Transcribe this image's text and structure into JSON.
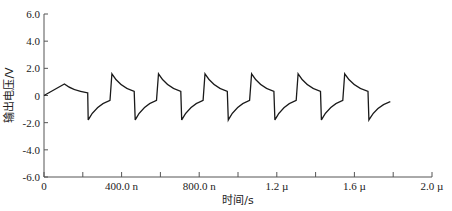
{
  "chart_data": {
    "type": "line",
    "title": "",
    "xlabel": "时间/s",
    "ylabel": "输出电压/V",
    "xlim": [
      0,
      2e-06
    ],
    "ylim": [
      -6.0,
      6.0
    ],
    "grid": false,
    "legend": null,
    "x_ticks": [
      {
        "value": 0,
        "label": "0"
      },
      {
        "value": 4e-07,
        "label": "400.0 n"
      },
      {
        "value": 8e-07,
        "label": "800.0 n"
      },
      {
        "value": 1.2e-06,
        "label": "1.2 µ"
      },
      {
        "value": 1.6e-06,
        "label": "1.6 µ"
      },
      {
        "value": 2e-06,
        "label": "2.0 µ"
      }
    ],
    "x_minor_ticks": [
      2e-07,
      6e-07,
      1e-06,
      1.4e-06,
      1.8e-06
    ],
    "y_ticks": [
      {
        "value": 6.0,
        "label": "6.0"
      },
      {
        "value": 4.0,
        "label": "4.0"
      },
      {
        "value": 2.0,
        "label": "2.0"
      },
      {
        "value": 0,
        "label": "0"
      },
      {
        "value": -2.0,
        "label": "-2.0"
      },
      {
        "value": -4.0,
        "label": "-4.0"
      },
      {
        "value": -6.0,
        "label": "-6.0"
      }
    ],
    "series": [
      {
        "name": "输出电压",
        "color": "#1a1a1a",
        "x_ns": [
          0,
          105,
          225,
          228,
          340,
          350,
          465,
          470,
          580,
          590,
          705,
          710,
          820,
          830,
          945,
          950,
          1060,
          1070,
          1185,
          1190,
          1300,
          1310,
          1425,
          1430,
          1540,
          1550,
          1670,
          1675,
          1785
        ],
        "y": [
          0,
          0.85,
          0.2,
          -1.8,
          -0.35,
          1.6,
          0.3,
          -1.8,
          -0.35,
          1.6,
          0.3,
          -1.8,
          -0.35,
          1.6,
          0.3,
          -1.8,
          -0.35,
          1.6,
          0.3,
          -1.8,
          -0.35,
          1.6,
          0.3,
          -1.8,
          -0.35,
          1.6,
          0.3,
          -1.8,
          -0.45
        ]
      }
    ]
  }
}
